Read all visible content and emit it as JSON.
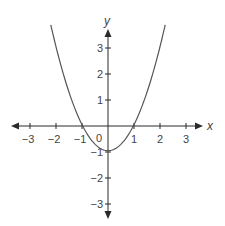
{
  "chart_data": {
    "type": "line",
    "title": "",
    "xlabel": "x",
    "ylabel": "y",
    "function": "y = x^2 - 1",
    "xlim": [
      -3.7,
      3.6
    ],
    "ylim": [
      -3.6,
      3.7
    ],
    "grid": false,
    "origin_label": "0",
    "x_ticks": [
      -3,
      -2,
      -1,
      1,
      2,
      3
    ],
    "x_tick_labels": [
      "−3",
      "−2",
      "−1",
      "1",
      "2",
      "3"
    ],
    "y_ticks": [
      3,
      2,
      1,
      -1,
      -2,
      -3
    ],
    "y_tick_labels": [
      "3",
      "2",
      "1",
      "−1",
      "−2",
      "−3"
    ],
    "series": [
      {
        "name": "parabola",
        "x": [
          -2.2,
          -2.0,
          -1.5,
          -1.0,
          -0.5,
          0.0,
          0.5,
          1.0,
          1.5,
          2.0,
          2.2
        ],
        "y": [
          3.84,
          3.0,
          1.25,
          0.0,
          -0.75,
          -1.0,
          -0.75,
          0.0,
          1.25,
          3.0,
          3.84
        ]
      }
    ],
    "roots": [
      -1,
      1
    ],
    "vertex": [
      0,
      -1
    ]
  },
  "colors": {
    "axis": "#2a2a2a",
    "curve": "#555555",
    "label": "#444444"
  }
}
